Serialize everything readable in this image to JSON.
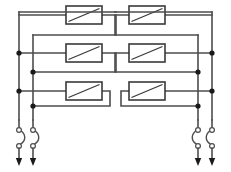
{
  "diagram": {
    "type": "electrical-schematic",
    "canvas": {
      "width": 231,
      "height": 172,
      "background": "#ffffff"
    },
    "style": {
      "wire_color": "#4d4d4d",
      "wire_width": 1.6,
      "box_stroke": "#3a3a3a",
      "box_fill": "#ffffff",
      "box_stroke_width": 1.6,
      "junction_color": "#1a1a1a",
      "junction_radius": 2.6,
      "arrow_color": "#1a1a1a",
      "contact_stroke": "#4d4d4d",
      "contact_fill": "#ffffff",
      "contact_radius": 2.4
    },
    "groups": [
      {
        "name": "left-group",
        "bus_a_x": 19,
        "bus_b_x": 33,
        "bus_top_y": 12,
        "bus_bottom_y": 120,
        "components": [
          {
            "name": "component-box-l1",
            "x": 66,
            "y": 6,
            "w": 36,
            "h": 18,
            "symbol": "diagonal-line",
            "row_y": 15,
            "loop_x": 116,
            "loop_return_y": 35,
            "tap_bus": "bus_b_x"
          },
          {
            "name": "component-box-l2",
            "x": 66,
            "y": 44,
            "w": 36,
            "h": 18,
            "symbol": "diagonal-line",
            "row_y": 53,
            "loop_x": 116,
            "loop_return_y": 72,
            "tap_bus": "bus_b_x"
          },
          {
            "name": "component-box-l3",
            "x": 66,
            "y": 82,
            "w": 36,
            "h": 18,
            "symbol": "diagonal-line",
            "row_y": 91,
            "loop_x": 110,
            "loop_return_y": 106,
            "tap_bus": "bus_b_x"
          }
        ],
        "junctions": [
          {
            "name": "junction-la",
            "x": 19,
            "y": 53
          },
          {
            "name": "junction-lb",
            "x": 19,
            "y": 91
          },
          {
            "name": "junction-lc",
            "x": 33,
            "y": 72
          },
          {
            "name": "junction-ld",
            "x": 33,
            "y": 106
          }
        ],
        "switches": [
          {
            "name": "switch-l1",
            "x": 19,
            "top_y": 120,
            "upper_contact_y": 130,
            "lower_contact_y": 146,
            "arrow_y": 166,
            "bow": "right"
          },
          {
            "name": "switch-l2",
            "x": 33,
            "top_y": 120,
            "upper_contact_y": 130,
            "lower_contact_y": 146,
            "arrow_y": 166,
            "bow": "right"
          }
        ]
      },
      {
        "name": "right-group",
        "bus_a_x": 212,
        "bus_b_x": 198,
        "bus_top_y": 12,
        "bus_bottom_y": 120,
        "components": [
          {
            "name": "component-box-r1",
            "x": 129,
            "y": 6,
            "w": 36,
            "h": 18,
            "symbol": "diagonal-line",
            "row_y": 15,
            "loop_x": 115,
            "loop_return_y": 35,
            "tap_bus": "bus_b_x"
          },
          {
            "name": "component-box-r2",
            "x": 129,
            "y": 44,
            "w": 36,
            "h": 18,
            "symbol": "diagonal-line",
            "row_y": 53,
            "loop_x": 115,
            "loop_return_y": 72,
            "tap_bus": "bus_b_x"
          },
          {
            "name": "component-box-r3",
            "x": 129,
            "y": 82,
            "w": 36,
            "h": 18,
            "symbol": "diagonal-line",
            "row_y": 91,
            "loop_x": 121,
            "loop_return_y": 106,
            "tap_bus": "bus_b_x"
          }
        ],
        "junctions": [
          {
            "name": "junction-ra",
            "x": 212,
            "y": 53
          },
          {
            "name": "junction-rb",
            "x": 212,
            "y": 91
          },
          {
            "name": "junction-rc",
            "x": 198,
            "y": 72
          },
          {
            "name": "junction-rd",
            "x": 198,
            "y": 106
          }
        ],
        "switches": [
          {
            "name": "switch-r1",
            "x": 198,
            "top_y": 120,
            "upper_contact_y": 130,
            "lower_contact_y": 146,
            "arrow_y": 166,
            "bow": "left"
          },
          {
            "name": "switch-r2",
            "x": 212,
            "top_y": 120,
            "upper_contact_y": 130,
            "lower_contact_y": 146,
            "arrow_y": 166,
            "bow": "left"
          }
        ]
      }
    ]
  }
}
